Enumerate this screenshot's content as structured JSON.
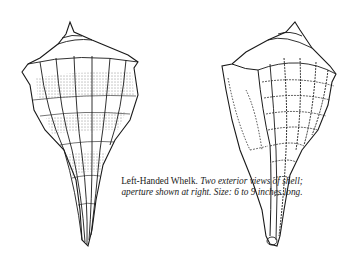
{
  "figure": {
    "subject": "Left-Handed Whelk",
    "views": [
      {
        "name": "left-shell",
        "description": "exterior view of shell, striped with bands"
      },
      {
        "name": "right-shell",
        "description": "exterior view of shell with aperture shown at right"
      }
    ],
    "colors": {
      "ink": "#1a1a1a",
      "paper": "#ffffff"
    }
  },
  "caption": {
    "lead": "Left-Handed Whelk.",
    "rest": "Two exterior views of shell; aperture shown at right. Size: 6 to 9 inches long."
  }
}
